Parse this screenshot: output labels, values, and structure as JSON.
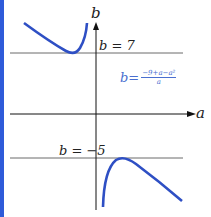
{
  "axes": {
    "x_label": "a",
    "y_label": "b"
  },
  "asymptotes": [
    {
      "label": "b = 7"
    },
    {
      "label": "b = −5"
    }
  ],
  "formula": {
    "lhs": "b=",
    "numerator": "−9+a−a²",
    "denominator": "a"
  },
  "colors": {
    "curve": "#2e4fc4",
    "left_bar": "#2e5bd9"
  }
}
